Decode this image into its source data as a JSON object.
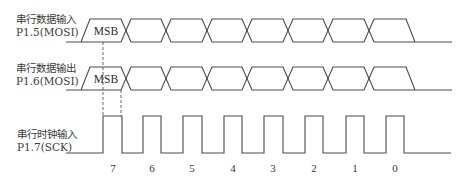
{
  "signals": [
    {
      "id": "mosi_in",
      "label_line1": "串行数据输入",
      "label_line2": "P1.5(MOSI)",
      "type": "data",
      "first_cell": "MSB"
    },
    {
      "id": "mosi_out",
      "label_line1": "串行数据输出",
      "label_line2": "P1.6(MOSI)",
      "type": "data",
      "first_cell": "MSB"
    },
    {
      "id": "sck",
      "label_line1": "串行时钟输入",
      "label_line2": "P1.7(SCK)",
      "type": "clock"
    }
  ],
  "bit_labels": [
    "7",
    "6",
    "5",
    "4",
    "3",
    "2",
    "1",
    "0"
  ],
  "colors": {
    "line": "#4a4a4a",
    "text": "#333333",
    "background": "#ffffff"
  }
}
